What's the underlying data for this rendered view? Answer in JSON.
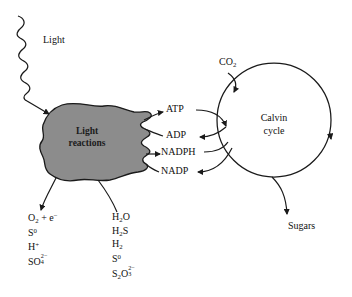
{
  "diagram": {
    "background_color": "#ffffff",
    "stroke_color": "#1a1a1a",
    "blob_fill_color": "#8c8c8c"
  },
  "light": {
    "label": "Light"
  },
  "light_reactions": {
    "label_line1": "Light",
    "label_line2": "reactions"
  },
  "calvin_cycle": {
    "label_line1": "Calvin",
    "label_line2": "cycle"
  },
  "exchange": [
    {
      "label": "ATP",
      "direction": "light-reactions-to-calvin"
    },
    {
      "label": "ADP",
      "direction": "calvin-to-light-reactions"
    },
    {
      "label": "NADPH",
      "direction": "light-reactions-to-calvin"
    },
    {
      "label": "NADP",
      "direction": "calvin-to-light-reactions"
    }
  ],
  "inputs": {
    "co2": {
      "text": "CO",
      "sub": "2"
    }
  },
  "outputs": {
    "sugars": "Sugars"
  },
  "products_list": {
    "rows": [
      {
        "id": "oxygen-electron",
        "parts": [
          {
            "t": "O"
          },
          {
            "sub": "2"
          },
          {
            "t": " + e"
          },
          {
            "sup": "−"
          }
        ]
      },
      {
        "id": "sulfur-zero",
        "parts": [
          {
            "t": "S"
          },
          {
            "sup": "0"
          }
        ]
      },
      {
        "id": "proton",
        "parts": [
          {
            "t": "H"
          },
          {
            "sup": "+"
          }
        ]
      },
      {
        "id": "sulfate",
        "parts": [
          {
            "t": "SO"
          },
          {
            "stack": {
              "sup": "2−",
              "sub": "4"
            }
          }
        ]
      }
    ]
  },
  "donors_list": {
    "rows": [
      {
        "id": "water",
        "parts": [
          {
            "t": "H"
          },
          {
            "sub": "2"
          },
          {
            "t": "O"
          }
        ]
      },
      {
        "id": "hydrogen-sulfide",
        "parts": [
          {
            "t": "H"
          },
          {
            "sub": "2"
          },
          {
            "t": "S"
          }
        ]
      },
      {
        "id": "hydrogen",
        "parts": [
          {
            "t": "H"
          },
          {
            "sub": "2"
          }
        ]
      },
      {
        "id": "sulfur-zero",
        "parts": [
          {
            "t": "S"
          },
          {
            "sup": "0"
          }
        ]
      },
      {
        "id": "thiosulfate",
        "parts": [
          {
            "t": "S"
          },
          {
            "sub": "2"
          },
          {
            "t": "O"
          },
          {
            "stack": {
              "sup": "2−",
              "sub": "3"
            }
          }
        ]
      }
    ]
  }
}
